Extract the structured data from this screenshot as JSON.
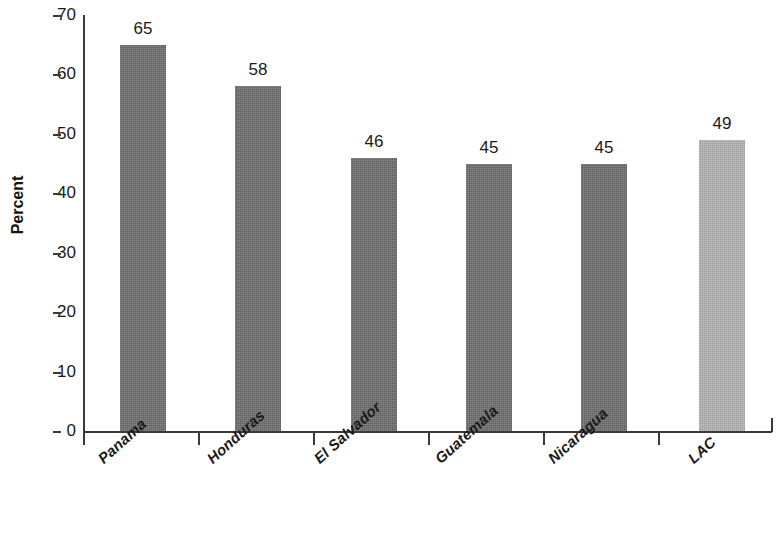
{
  "chart_data": {
    "type": "bar",
    "title": "",
    "subtitle": "",
    "xlabel": "",
    "ylabel": "Percent",
    "categories": [
      "Panama",
      "Honduras",
      "El Salvador",
      "Guatemala",
      "Nicaragua",
      "LAC"
    ],
    "values": [
      65,
      58,
      46,
      45,
      45,
      49
    ],
    "value_labels": [
      "65",
      "58",
      "46",
      "45",
      "45",
      "49"
    ],
    "ylim": [
      0,
      70
    ],
    "ytick_labels": [
      "0",
      "10",
      "20",
      "30",
      "40",
      "50",
      "60",
      "70"
    ],
    "ytick_values": [
      0,
      10,
      20,
      30,
      40,
      50,
      60,
      70
    ],
    "grid": false,
    "legend": false,
    "legend_position": "none",
    "bar_colors": [
      "#6d6d6d",
      "#6d6d6d",
      "#6d6d6d",
      "#6d6d6d",
      "#6d6d6d",
      "#b3b3b3"
    ],
    "highlight_category": "LAC",
    "axis_color": "#3a3a3a",
    "background_color": "#ffffff",
    "text_color": "#1a1a1a"
  }
}
